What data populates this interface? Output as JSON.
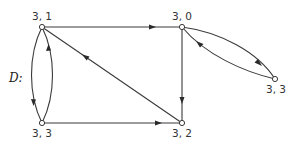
{
  "graph": {
    "name": "D:",
    "nodes": [
      {
        "id": "n31",
        "label": "3, 1",
        "x": 42,
        "y": 27,
        "label_dx": 0,
        "label_dy": -7
      },
      {
        "id": "n30",
        "label": "3, 0",
        "x": 182,
        "y": 27,
        "label_dx": 0,
        "label_dy": -7
      },
      {
        "id": "n33a",
        "label": "3, 3",
        "x": 42,
        "y": 123,
        "label_dx": 0,
        "label_dy": 14
      },
      {
        "id": "n32",
        "label": "3, 2",
        "x": 182,
        "y": 123,
        "label_dx": 0,
        "label_dy": 14
      },
      {
        "id": "n33b",
        "label": "3, 3",
        "x": 275,
        "y": 79,
        "label_dx": 0,
        "label_dy": 14
      }
    ],
    "edges": [
      {
        "from": "n31",
        "to": "n30",
        "type": "straight"
      },
      {
        "from": "n30",
        "to": "n32",
        "type": "straight"
      },
      {
        "from": "n33a",
        "to": "n32",
        "type": "straight"
      },
      {
        "from": "n32",
        "to": "n31",
        "type": "straight"
      },
      {
        "from": "n31",
        "to": "n33a",
        "type": "curve-left"
      },
      {
        "from": "n33a",
        "to": "n31",
        "type": "curve-right"
      },
      {
        "from": "n30",
        "to": "n33b",
        "type": "curve-upper"
      },
      {
        "from": "n33b",
        "to": "n30",
        "type": "curve-lower"
      }
    ]
  }
}
